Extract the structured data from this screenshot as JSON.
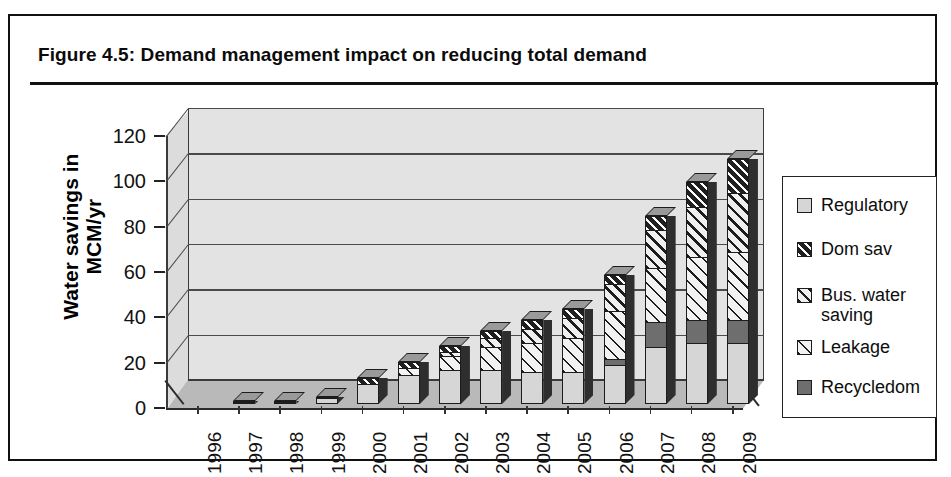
{
  "figure": {
    "title": "Figure 4.5:  Demand management impact on reducing total demand"
  },
  "chart_data": {
    "type": "bar",
    "subtype": "stacked-3d-column",
    "title": "Demand management impact on reducing total demand",
    "xlabel": "",
    "ylabel": "Water savings in MCM/yr",
    "ylim": [
      0,
      120
    ],
    "ytick_step": 20,
    "yticks": [
      0,
      20,
      40,
      60,
      80,
      100,
      120
    ],
    "grid": true,
    "legend_position": "right",
    "categories": [
      "1996",
      "1997",
      "1998",
      "1999",
      "2000",
      "2001",
      "2002",
      "2003",
      "2004",
      "2005",
      "2006",
      "2007",
      "2008",
      "2009"
    ],
    "series": [
      {
        "name": "Regulatory",
        "pattern": "solid-light-gray",
        "color": "#d6d6d6",
        "values": [
          0,
          0.8,
          0.8,
          2.5,
          9,
          13,
          15,
          15,
          14,
          14,
          17,
          25,
          27,
          27
        ]
      },
      {
        "name": "Recycledom",
        "pattern": "solid-dark-gray",
        "color": "#6e6e6e",
        "values": [
          0,
          0,
          0,
          0,
          0,
          0,
          0,
          0,
          0,
          0,
          3,
          11,
          10,
          10
        ]
      },
      {
        "name": "Leakage",
        "pattern": "light-diagonal-hatch",
        "color": "#f2f2f2",
        "values": [
          0,
          0,
          0,
          0,
          0,
          3,
          6,
          10,
          13,
          15,
          21,
          24,
          28,
          30
        ]
      },
      {
        "name": "Bus. water saving",
        "pattern": "diagonal-hatch",
        "color": "#efefef",
        "values": [
          0,
          0,
          0,
          0,
          0,
          0,
          2,
          4,
          6,
          9,
          12,
          17,
          22,
          26
        ]
      },
      {
        "name": "Dom sav",
        "pattern": "dark-diagonal-hatch",
        "color": "#1f1f1f",
        "values": [
          0,
          0.5,
          0.5,
          0.8,
          2.5,
          2.5,
          2.5,
          3,
          4,
          4,
          4,
          6,
          11,
          15
        ]
      }
    ],
    "totals": [
      0,
      1.3,
      1.3,
      3.3,
      11.5,
      18.5,
      25.5,
      32,
      37,
      42,
      57,
      83,
      98,
      108
    ]
  },
  "legend": {
    "items": [
      {
        "label": "Regulatory",
        "swatch": "solid-light-gray-swatch"
      },
      {
        "label": "Dom sav",
        "swatch": "dark-diagonal-hatch-swatch"
      },
      {
        "label": "Bus. water\nsaving",
        "swatch": "diagonal-hatch-swatch"
      },
      {
        "label": "Leakage",
        "swatch": "light-diagonal-hatch-swatch"
      },
      {
        "label": "Recycledom",
        "swatch": "solid-dark-gray-swatch"
      }
    ]
  }
}
